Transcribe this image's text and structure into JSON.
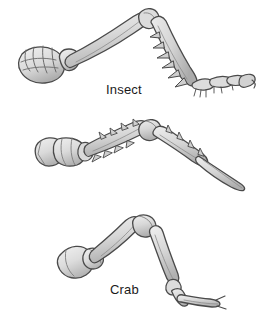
{
  "figure": {
    "background_color": "#ffffff",
    "outline_color": "#4a4a4a",
    "fill_light": "#e6e6e6",
    "fill_mid": "#cfcfcf",
    "fill_dark": "#b0b0b0",
    "label_color": "#1a1a1a"
  },
  "specimens": [
    {
      "id": "insect",
      "label": "Insect",
      "description": "Jointed insect leg with broad coxa, long femur, spined tibia and five-segmented tarsus ending in claws",
      "has_spines": true,
      "segment_count": 5
    },
    {
      "id": "crab",
      "label": "Crab",
      "description": "Crab walking leg with blocky coxa, spiny merus and carpus, and a long pointed dactyl",
      "has_spines": true,
      "segment_count": 5
    },
    {
      "id": "spider",
      "label": "Spider",
      "description": "Smooth spider leg with rounded coxa, femur, patella, tibia and downturned tarsus",
      "has_spines": false,
      "segment_count": 5
    }
  ]
}
